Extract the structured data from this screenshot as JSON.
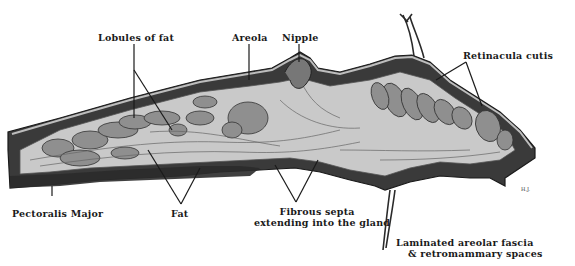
{
  "figure": {
    "labels": {
      "lobules_of_fat": "Lobules of fat",
      "areola": "Areola",
      "nipple": "Nipple",
      "retinacula_cutis": "Retinacula cutis",
      "pectoralis_major": "Pectoralis Major",
      "fat": "Fat",
      "fibrous_septa_line1": "Fibrous septa",
      "fibrous_septa_line2": "extending into the gland",
      "laminated_line1": "Laminated areolar fascia",
      "laminated_line2": "& retromammary spaces",
      "signature": "H.J."
    },
    "colors": {
      "ink": "#1a1a1a",
      "skin_dark": "#2b2b2b",
      "muscle": "#3a3a3a",
      "fat_lobule": "#8f8f8f",
      "gland_light": "#c9c9c9",
      "background": "#ffffff"
    }
  }
}
